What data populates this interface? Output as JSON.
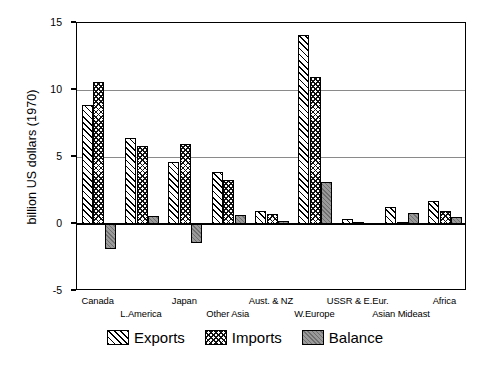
{
  "chart_data": {
    "type": "bar",
    "title": "",
    "xlabel": "",
    "ylabel": "billion US dollars (1970)",
    "ylim": [
      -5,
      15
    ],
    "yticks": [
      15,
      10,
      5,
      0,
      -5
    ],
    "grid": true,
    "legend_position": "bottom",
    "categories": [
      "Canada",
      "L.America",
      "Japan",
      "Other Asia",
      "Aust. & NZ",
      "W.Europe",
      "USSR & E.Eur.",
      "Asian Mideast",
      "Africa"
    ],
    "series": [
      {
        "name": "Exports",
        "pattern": "diagonal-hatch",
        "values": [
          8.9,
          6.4,
          4.6,
          3.9,
          1.0,
          14.1,
          0.35,
          1.3,
          1.7
        ]
      },
      {
        "name": "Imports",
        "pattern": "cross-hatch",
        "values": [
          10.6,
          5.8,
          6.0,
          3.3,
          0.75,
          11.0,
          0.15,
          0.15,
          1.0
        ]
      },
      {
        "name": "Balance",
        "pattern": "solid-gray",
        "values": [
          -1.9,
          0.6,
          -1.4,
          0.65,
          0.25,
          3.1,
          0.1,
          0.85,
          0.55
        ]
      }
    ]
  },
  "legend": {
    "items": [
      {
        "label": "Exports"
      },
      {
        "label": "Imports"
      },
      {
        "label": "Balance"
      }
    ]
  },
  "colors": {
    "axis": "#000000",
    "grid": "#8a8a8a",
    "balance_fill": "#9a9a9a",
    "background": "#ffffff"
  }
}
